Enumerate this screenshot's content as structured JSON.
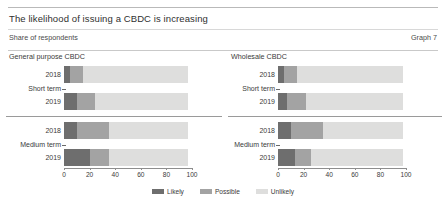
{
  "header": {
    "title": "The likelihood of issuing a CBDC is increasing",
    "subtitle": "Share of respondents",
    "graph_number": "Graph 7"
  },
  "legend": {
    "position": "bottom-center",
    "items": [
      {
        "label": "Likely",
        "color": "#6e6e6e",
        "icon": "legend-swatch-icon"
      },
      {
        "label": "Possible",
        "color": "#a3a3a3",
        "icon": "legend-swatch-icon"
      },
      {
        "label": "Unlikely",
        "color": "#dededd",
        "icon": "legend-swatch-icon"
      }
    ]
  },
  "panels": [
    {
      "title": "General purpose CBDC",
      "groups": [
        {
          "label": "Short term",
          "rows": [
            "2018",
            "2019"
          ]
        },
        {
          "label": "Medium term",
          "rows": [
            "2018",
            "2019"
          ]
        }
      ]
    },
    {
      "title": "Wholesale CBDC",
      "groups": [
        {
          "label": "Short term",
          "rows": [
            "2018",
            "2019"
          ]
        },
        {
          "label": "Medium term",
          "rows": [
            "2018",
            "2019"
          ]
        }
      ]
    }
  ],
  "axis": {
    "ticks": [
      "0",
      "20",
      "40",
      "60",
      "80",
      "100"
    ],
    "min": 0,
    "max": 100
  },
  "chart_data": [
    {
      "type": "bar",
      "title": "General purpose CBDC",
      "subtitle": "Share of respondents",
      "orientation": "horizontal",
      "stacked": true,
      "xlabel": "",
      "ylabel": "",
      "xlim": [
        0,
        100
      ],
      "grid": false,
      "legend_position": "bottom-center",
      "categories": [
        "Short term 2018",
        "Short term 2019",
        "Medium term 2018",
        "Medium term 2019"
      ],
      "series": [
        {
          "name": "Likely",
          "color": "#6e6e6e",
          "values": [
            5,
            10,
            10,
            20
          ]
        },
        {
          "name": "Possible",
          "color": "#a3a3a3",
          "values": [
            10,
            14,
            25,
            15
          ]
        },
        {
          "name": "Unlikely",
          "color": "#dededd",
          "values": [
            82,
            73,
            62,
            62
          ]
        }
      ],
      "xticks": [
        0,
        20,
        40,
        60,
        80,
        100
      ]
    },
    {
      "type": "bar",
      "title": "Wholesale CBDC",
      "subtitle": "Share of respondents",
      "orientation": "horizontal",
      "stacked": true,
      "xlabel": "",
      "ylabel": "",
      "xlim": [
        0,
        100
      ],
      "grid": false,
      "legend_position": "bottom-center",
      "categories": [
        "Short term 2018",
        "Short term 2019",
        "Medium term 2018",
        "Medium term 2019"
      ],
      "series": [
        {
          "name": "Likely",
          "color": "#6e6e6e",
          "values": [
            5,
            7,
            10,
            13
          ]
        },
        {
          "name": "Possible",
          "color": "#a3a3a3",
          "values": [
            10,
            15,
            25,
            13
          ]
        },
        {
          "name": "Unlikely",
          "color": "#dededd",
          "values": [
            83,
            76,
            63,
            72
          ]
        }
      ],
      "xticks": [
        0,
        20,
        40,
        60,
        80,
        100
      ]
    }
  ]
}
